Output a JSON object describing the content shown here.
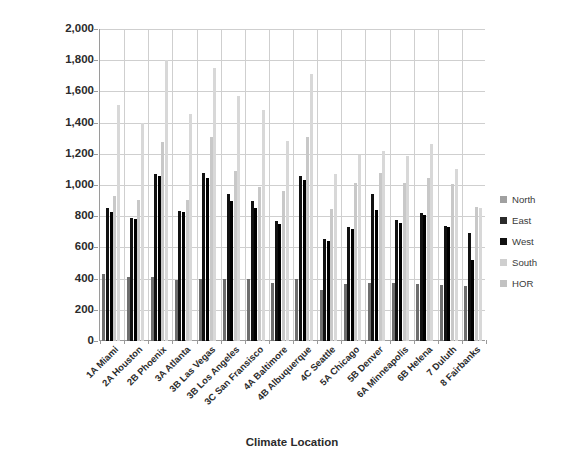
{
  "chart_data": {
    "type": "bar",
    "title": "",
    "xlabel": "Climate Location",
    "ylabel": "Solar Radiation - Btu/ft2-day",
    "ylim": [
      0,
      2000
    ],
    "ytick_step": 200,
    "ytick_labels": [
      "0",
      "200",
      "400",
      "600",
      "800",
      "1,000",
      "1,200",
      "1,400",
      "1,600",
      "1,800",
      "2,000"
    ],
    "grid": true,
    "legend_position": "right",
    "categories": [
      "1A Miami",
      "2A Houston",
      "2B Phoenix",
      "3A Atlanta",
      "3B Las Vegas",
      "3B Los Angeles",
      "3C San Fransisco",
      "4A Baltimore",
      "4B Albuquerque",
      "4C Seattle",
      "5A Chicago",
      "5B Denver",
      "6A Minneapolis",
      "6B Helena",
      "7 Duluth",
      "8 Fairbanks"
    ],
    "series": [
      {
        "name": "North",
        "color": "#6e6e6e",
        "values": [
          430,
          410,
          410,
          390,
          395,
          400,
          395,
          375,
          395,
          330,
          365,
          370,
          375,
          365,
          360,
          355
        ]
      },
      {
        "name": "East",
        "color": "#111111",
        "values": [
          855,
          790,
          1070,
          835,
          1075,
          945,
          900,
          770,
          1060,
          655,
          730,
          940,
          775,
          820,
          735,
          695
        ]
      },
      {
        "name": "West",
        "color": "#000000",
        "values": [
          825,
          785,
          1055,
          825,
          1045,
          900,
          855,
          750,
          1035,
          640,
          720,
          840,
          755,
          805,
          730,
          520
        ]
      },
      {
        "name": "South",
        "color": "#c8c8c8",
        "values": [
          930,
          905,
          1275,
          905,
          1310,
          1090,
          985,
          960,
          1305,
          845,
          1015,
          1080,
          1010,
          1045,
          1005,
          860
        ]
      },
      {
        "name": "HOR",
        "color": "#d8d8d8",
        "values": [
          1510,
          1400,
          1800,
          1455,
          1750,
          1570,
          1480,
          1285,
          1710,
          1070,
          1190,
          1215,
          1185,
          1260,
          1105,
          855
        ]
      }
    ]
  },
  "legend": {
    "items": [
      {
        "label": "North",
        "color": "#a0a0a0"
      },
      {
        "label": "East",
        "color": "#2b2b2b"
      },
      {
        "label": "West",
        "color": "#111111"
      },
      {
        "label": "South",
        "color": "#cfcfcf"
      },
      {
        "label": "HOR",
        "color": "#c2c2c2"
      }
    ]
  }
}
